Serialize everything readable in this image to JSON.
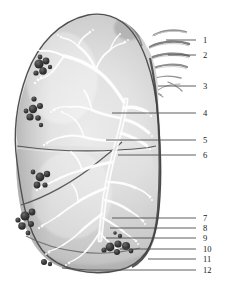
{
  "figure": {
    "view": "lateral surface of right lung, costal aspect",
    "style": "grayscale pencil / airbrush anatomical illustration",
    "background_color": "#ffffff",
    "lung_fill_light": "#f2f2f2",
    "lung_fill_mid": "#c9c9c9",
    "lung_fill_dark": "#8f8f8f",
    "outline_color": "#4a4a4a",
    "bronchial_tree_color": "#ffffff",
    "lymph_node_color": "#3b3b3b",
    "leader_line_color": "#4d4d4d",
    "rib_color": "#6e6e6e"
  },
  "callouts": [
    {
      "number": "1",
      "y": 40,
      "leader_from_x": 166,
      "leader_from_y": 40,
      "target": "rib-1"
    },
    {
      "number": "2",
      "y": 55,
      "leader_from_x": 168,
      "leader_from_y": 55,
      "target": "rib-2"
    },
    {
      "number": "3",
      "y": 86,
      "leader_from_x": 158,
      "leader_from_y": 86,
      "target": "rib-3"
    },
    {
      "number": "4",
      "y": 113,
      "leader_from_x": 112,
      "leader_from_y": 113,
      "target": "upper-lobe-bronchus"
    },
    {
      "number": "5",
      "y": 140,
      "leader_from_x": 106,
      "leader_from_y": 140,
      "target": "horizontal-fissure-bronchus"
    },
    {
      "number": "6",
      "y": 155,
      "leader_from_x": 118,
      "leader_from_y": 155,
      "target": "horizontal-fissure"
    },
    {
      "number": "7",
      "y": 218,
      "leader_from_x": 112,
      "leader_from_y": 218,
      "target": "lower-lobe-branch"
    },
    {
      "number": "8",
      "y": 228,
      "leader_from_x": 110,
      "leader_from_y": 228,
      "target": "segmental-bronchus"
    },
    {
      "number": "9",
      "y": 238,
      "leader_from_x": 106,
      "leader_from_y": 238,
      "target": "subsegmental-bronchus"
    },
    {
      "number": "10",
      "y": 249,
      "leader_from_x": 120,
      "leader_from_y": 249,
      "target": "lymph-node-cluster-lower"
    },
    {
      "number": "11",
      "y": 259,
      "leader_from_x": 148,
      "leader_from_y": 259,
      "target": "lung-base-border"
    },
    {
      "number": "12",
      "y": 270,
      "leader_from_x": 62,
      "leader_from_y": 270,
      "target": "diaphragmatic-surface"
    }
  ],
  "label_x": 203,
  "leader_end_x": 196,
  "ribs": [
    {
      "name": "rib-stripe-1",
      "y": 33
    },
    {
      "name": "rib-stripe-2",
      "y": 45
    },
    {
      "name": "rib-stripe-3",
      "y": 57
    },
    {
      "name": "rib-stripe-4",
      "y": 68
    },
    {
      "name": "rib-arc-5",
      "y": 80
    },
    {
      "name": "rib-arc-6",
      "y": 90
    }
  ],
  "caption": {
    "text": ""
  }
}
